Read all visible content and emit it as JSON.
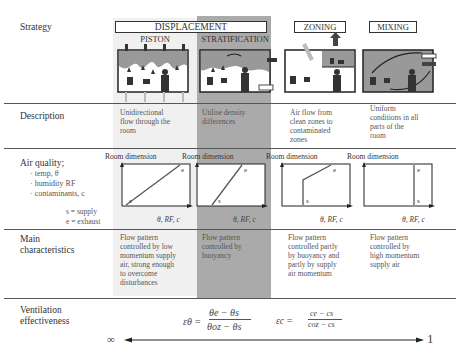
{
  "rows": {
    "strategy": "Strategy",
    "description": "Description",
    "air_quality": {
      "title": "Air quality;",
      "items": [
        "temp, θ",
        "humidity RF",
        "contaminants, c"
      ],
      "legend": [
        "s = supply",
        "e = exhaust"
      ]
    },
    "main": [
      "Main",
      "characteristics"
    ],
    "ventilation": [
      "Ventilation",
      "effectiveness"
    ]
  },
  "headers": {
    "displacement": "DISPLACEMENT",
    "piston": "PISTON",
    "stratification": "STRATIFICATION",
    "zoning": "ZONING",
    "mixing": "MIXING"
  },
  "columns": [
    {
      "key": "piston",
      "description": [
        "Unidirectional",
        "flow through the",
        "room"
      ],
      "main": [
        "Flow pattern",
        "controlled by low",
        "momentum supply",
        "air, strong enough",
        "to overcome",
        "disturbances"
      ],
      "chart": {
        "title": "Room dimension",
        "xlabel": "θ, RF, c",
        "profile": "diagonal",
        "labels": [
          "s",
          "e"
        ]
      }
    },
    {
      "key": "stratification",
      "description": [
        "Utilise density",
        "differences"
      ],
      "main": [
        "Flow pattern",
        "controlled by",
        "buoyancy"
      ],
      "chart": {
        "title": "Room dimension",
        "xlabel": "θ, RF, c",
        "profile": "steep-diagonal",
        "labels": [
          "s",
          "e"
        ]
      }
    },
    {
      "key": "zoning",
      "description": [
        "Air flow from",
        "clean zones to",
        "contaminated",
        "zones"
      ],
      "main": [
        "Flow pattern",
        "controlled partly",
        "by buoyancy and",
        "partly by supply",
        "air momentum"
      ],
      "chart": {
        "title": "Room dimension",
        "xlabel": "θ, RF, c",
        "profile": "vertical-then-diagonal",
        "labels": [
          "s",
          "e"
        ]
      }
    },
    {
      "key": "mixing",
      "description": [
        "Uniform",
        "conditions in all",
        "parts of the",
        "room"
      ],
      "main": [
        "Flow pattern",
        "controlled by",
        "high momentum",
        "supply air"
      ],
      "chart": {
        "title": "Room dimension",
        "xlabel": "θ, RF, c",
        "profile": "vertical",
        "labels": [
          "s",
          "e"
        ]
      }
    }
  ],
  "effectiveness": {
    "formula_theta": {
      "lhs": "εθ =",
      "num": "θe − θs",
      "den": "θoz − θs"
    },
    "formula_c": {
      "lhs": "εc =",
      "num": "ce − cs",
      "den": "coz − cs"
    },
    "scale_left": "∞",
    "scale_right": "1"
  },
  "colors": {
    "shade_light": "#f0f0f0",
    "shade_dark": "#aaaaaa",
    "line": "#555555",
    "room_fill": "#9a9a9a"
  }
}
